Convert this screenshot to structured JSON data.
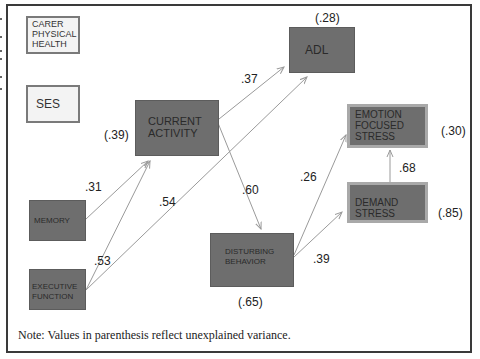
{
  "nodes": {
    "carer_physical_health": {
      "lines": [
        "CARER",
        "PHYSICAL",
        "HEALTH"
      ]
    },
    "ses": {
      "lines": [
        "SES"
      ]
    },
    "current_activity": {
      "lines": [
        "CURRENT",
        "ACTIVITY"
      ],
      "variance": "(.39)"
    },
    "adl": {
      "lines": [
        "ADL"
      ],
      "variance": "(.28)"
    },
    "memory": {
      "lines": [
        "MEMORY"
      ]
    },
    "executive_function": {
      "lines": [
        "EXECUTIVE",
        "FUNCTION"
      ]
    },
    "disturbing_behavior": {
      "lines": [
        "DISTURBING",
        "BEHAVIOR"
      ],
      "variance": "(.65)"
    },
    "emotion_focused_stress": {
      "lines": [
        "EMOTION",
        "FOCUSED",
        "STRESS"
      ],
      "variance": "(.30)"
    },
    "demand_stress": {
      "lines": [
        "DEMAND",
        "STRESS"
      ],
      "variance": "(.85)"
    }
  },
  "paths": {
    "memory_to_current_activity": ".31",
    "executive_to_current_activity": ".53",
    "executive_to_adl": ".54",
    "current_activity_to_adl": ".37",
    "current_activity_to_disturbing": ".60",
    "disturbing_to_emotion": ".26",
    "disturbing_to_demand": ".39",
    "demand_to_emotion": ".68"
  },
  "colors": {
    "node_dark": "#6e6e6e",
    "node_light": "#f3f3f3",
    "arrow": "#9a9a9a",
    "frame": "#3a3a3a"
  },
  "note": "Note:  Values in parenthesis reflect unexplained variance."
}
